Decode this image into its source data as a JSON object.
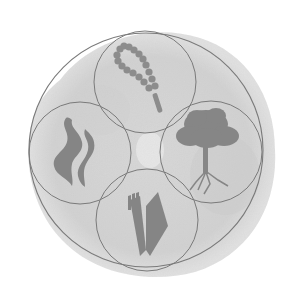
{
  "image": {
    "width": 292,
    "height": 301,
    "background": "#ffffff",
    "wash_color": "#d4d4d4",
    "line_color": "#7a7a7a",
    "symbol_color": "#8a8a8a"
  },
  "emblem": {
    "outer_circle": {
      "cx": 146,
      "cy": 150,
      "r": 117
    },
    "circles": [
      {
        "name": "top",
        "cx": 145,
        "cy": 82,
        "r": 51,
        "symbol": "rosary-icon"
      },
      {
        "name": "left",
        "cx": 80,
        "cy": 153,
        "r": 51,
        "symbol": "flame-icon"
      },
      {
        "name": "right",
        "cx": 211,
        "cy": 152,
        "r": 51,
        "symbol": "tree-icon"
      },
      {
        "name": "bottom",
        "cx": 147,
        "cy": 220,
        "r": 51,
        "symbol": "book-icon"
      }
    ]
  }
}
